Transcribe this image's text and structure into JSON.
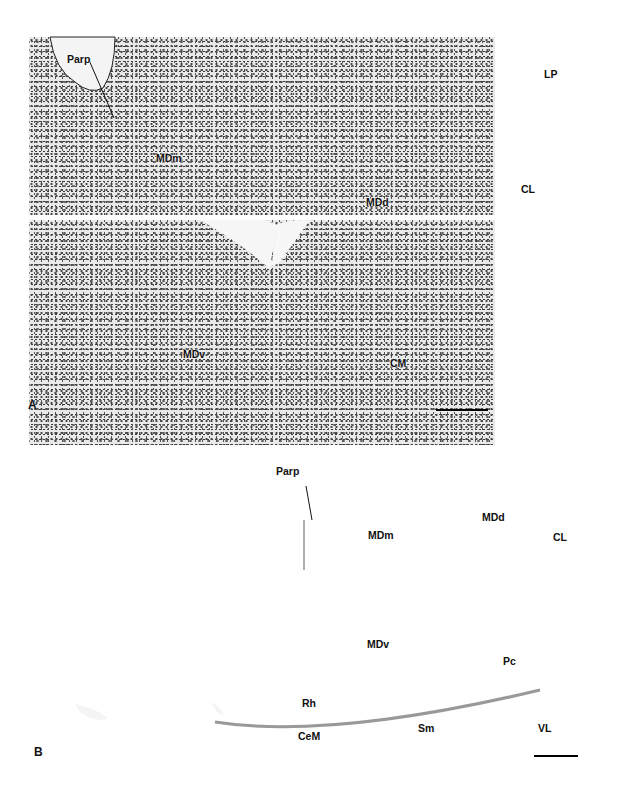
{
  "figure": {
    "panels": [
      {
        "id": "A",
        "panel_label": "A",
        "labels": {
          "parp": "Parp",
          "mdm": "MDm",
          "mdd": "MDd",
          "lp": "LP",
          "cl": "CL",
          "mdv": "MDv",
          "cm": "CM"
        },
        "scale_bar": true
      },
      {
        "id": "B",
        "panel_label": "B",
        "labels": {
          "parp": "Parp",
          "mdm": "MDm",
          "mdd": "MDd",
          "cl": "CL",
          "mdv": "MDv",
          "pc": "Pc",
          "rh": "Rh",
          "cem": "CeM",
          "sm": "Sm",
          "vl": "VL"
        },
        "scale_bar": true
      }
    ]
  }
}
